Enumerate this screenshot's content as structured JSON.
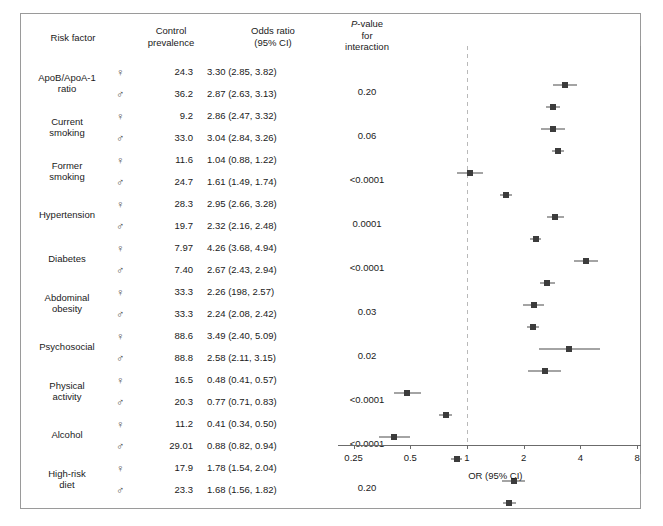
{
  "header": {
    "risk_factor": "Risk factor",
    "control_prevalence": "Control\nprevalence",
    "control_prevalence_l1": "Control",
    "control_prevalence_l2": "prevalence",
    "odds_ratio_l1": "Odds ratio",
    "odds_ratio_l2": "(95% CI)",
    "pvalue_l1": "P-value",
    "pvalue_l2": "for",
    "pvalue_l3": "interaction"
  },
  "axis": {
    "title": "OR (95% CI)",
    "ticks": [
      "0.25",
      "0.5",
      "1",
      "2",
      "4",
      "8"
    ],
    "tick_values": [
      0.25,
      0.5,
      1,
      2,
      4,
      8
    ],
    "reference_line": 1
  },
  "symbols": {
    "female": "♀",
    "male": "♂"
  },
  "colors": {
    "marker": "#3c3c3c",
    "axis": "#6b6b6b",
    "reference_line": "#b9b9b9",
    "border": "#9a9a9a",
    "text": "#1a1a1a"
  },
  "chart_data": {
    "type": "scatter",
    "title": "",
    "xlabel": "OR (95% CI)",
    "ylabel": "",
    "xscale": "log",
    "xlim": [
      0.2,
      9.2
    ],
    "xticks": [
      0.25,
      0.5,
      1,
      2,
      4,
      8
    ],
    "grid": false,
    "legend": "none",
    "reference_line": 1,
    "groups": [
      {
        "label": "ApoB/ApoA-1\nratio",
        "label_l1": "ApoB/ApoA-1",
        "label_l2": "ratio",
        "p_value": "0.20",
        "rows": [
          {
            "sex": "female",
            "prevalence": "24.3",
            "or_text": "3.30 (2.85, 3.82)",
            "or": 3.3,
            "lcl": 2.85,
            "ucl": 3.82
          },
          {
            "sex": "male",
            "prevalence": "36.2",
            "or_text": "2.87 (2.63, 3.13)",
            "or": 2.87,
            "lcl": 2.63,
            "ucl": 3.13
          }
        ]
      },
      {
        "label": "Current\nsmoking",
        "label_l1": "Current",
        "label_l2": "smoking",
        "p_value": "0.06",
        "rows": [
          {
            "sex": "female",
            "prevalence": "9.2",
            "or_text": "2.86 (2.47, 3.32)",
            "or": 2.86,
            "lcl": 2.47,
            "ucl": 3.32
          },
          {
            "sex": "male",
            "prevalence": "33.0",
            "or_text": "3.04 (2.84, 3.26)",
            "or": 3.04,
            "lcl": 2.84,
            "ucl": 3.26
          }
        ]
      },
      {
        "label": "Former\nsmoking",
        "label_l1": "Former",
        "label_l2": "smoking",
        "p_value": "<0.0001",
        "rows": [
          {
            "sex": "female",
            "prevalence": "11.6",
            "or_text": "1.04 (0.88, 1.22)",
            "or": 1.04,
            "lcl": 0.88,
            "ucl": 1.22
          },
          {
            "sex": "male",
            "prevalence": "24.7",
            "or_text": "1.61 (1.49, 1.74)",
            "or": 1.61,
            "lcl": 1.49,
            "ucl": 1.74
          }
        ]
      },
      {
        "label": "Hypertension",
        "label_l1": "Hypertension",
        "label_l2": "",
        "p_value": "0.0001",
        "rows": [
          {
            "sex": "female",
            "prevalence": "28.3",
            "or_text": "2.95 (2.66, 3.28)",
            "or": 2.95,
            "lcl": 2.66,
            "ucl": 3.28
          },
          {
            "sex": "male",
            "prevalence": "19.7",
            "or_text": "2.32 (2.16, 2.48)",
            "or": 2.32,
            "lcl": 2.16,
            "ucl": 2.48
          }
        ]
      },
      {
        "label": "Diabetes",
        "label_l1": "Diabetes",
        "label_l2": "",
        "p_value": "<0.0001",
        "rows": [
          {
            "sex": "female",
            "prevalence": "7.97",
            "or_text": "4.26 (3.68, 4.94)",
            "or": 4.26,
            "lcl": 3.68,
            "ucl": 4.94
          },
          {
            "sex": "male",
            "prevalence": "7.40",
            "or_text": "2.67 (2.43, 2.94)",
            "or": 2.67,
            "lcl": 2.43,
            "ucl": 2.94
          }
        ]
      },
      {
        "label": "Abdominal\nobesity",
        "label_l1": "Abdominal",
        "label_l2": "obesity",
        "p_value": "0.03",
        "rows": [
          {
            "sex": "female",
            "prevalence": "33.3",
            "or_text": "2.26 (198, 2.57)",
            "or": 2.26,
            "lcl": 1.98,
            "ucl": 2.57
          },
          {
            "sex": "male",
            "prevalence": "33.3",
            "or_text": "2.24 (2.08, 2.42)",
            "or": 2.24,
            "lcl": 2.08,
            "ucl": 2.42
          }
        ]
      },
      {
        "label": "Psychosocial",
        "label_l1": "Psychosocial",
        "label_l2": "",
        "p_value": "0.02",
        "rows": [
          {
            "sex": "female",
            "prevalence": "88.6",
            "or_text": "3.49 (2.40, 5.09)",
            "or": 3.49,
            "lcl": 2.4,
            "ucl": 5.09
          },
          {
            "sex": "male",
            "prevalence": "88.8",
            "or_text": "2.58 (2.11, 3.15)",
            "or": 2.58,
            "lcl": 2.11,
            "ucl": 3.15
          }
        ]
      },
      {
        "label": "Physical\nactivity",
        "label_l1": "Physical",
        "label_l2": "activity",
        "p_value": "<0.0001",
        "rows": [
          {
            "sex": "female",
            "prevalence": "16.5",
            "or_text": "0.48 (0.41, 0.57)",
            "or": 0.48,
            "lcl": 0.41,
            "ucl": 0.57
          },
          {
            "sex": "male",
            "prevalence": "20.3",
            "or_text": "0.77 (0.71, 0.83)",
            "or": 0.77,
            "lcl": 0.71,
            "ucl": 0.83
          }
        ]
      },
      {
        "label": "Alcohol",
        "label_l1": "Alcohol",
        "label_l2": "",
        "p_value": "<0.0001",
        "rows": [
          {
            "sex": "female",
            "prevalence": "11.2",
            "or_text": "0.41 (0.34, 0.50)",
            "or": 0.41,
            "lcl": 0.34,
            "ucl": 0.5
          },
          {
            "sex": "male",
            "prevalence": "29.01",
            "or_text": "0.88 (0.82, 0.94)",
            "or": 0.88,
            "lcl": 0.82,
            "ucl": 0.94
          }
        ]
      },
      {
        "label": "High-risk\ndiet",
        "label_l1": "High-risk",
        "label_l2": "diet",
        "p_value": "0.20",
        "rows": [
          {
            "sex": "female",
            "prevalence": "17.9",
            "or_text": "1.78 (1.54, 2.04)",
            "or": 1.78,
            "lcl": 1.54,
            "ucl": 2.04
          },
          {
            "sex": "male",
            "prevalence": "23.3",
            "or_text": "1.68 (1.56, 1.82)",
            "or": 1.68,
            "lcl": 1.56,
            "ucl": 1.82
          }
        ]
      }
    ]
  }
}
